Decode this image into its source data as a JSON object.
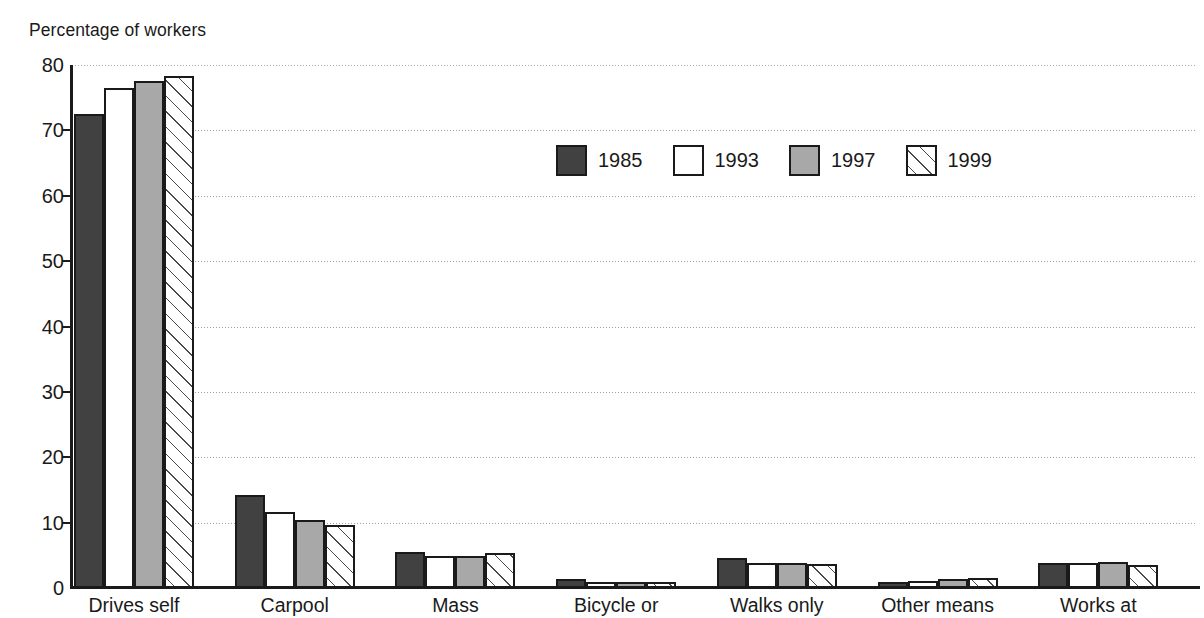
{
  "chart_data": {
    "type": "bar",
    "title": "",
    "ylabel": "Percentage of workers",
    "xlabel": "",
    "ylim": [
      0,
      80
    ],
    "ytick_step": 10,
    "yticks": [
      "0",
      "10",
      "20",
      "30",
      "40",
      "50",
      "60",
      "70",
      "80"
    ],
    "grid": true,
    "grid_axis": "y",
    "legend_position": "upper-center",
    "categories": [
      "Drives self",
      "Carpool",
      "Mass",
      "Bicycle or",
      "Walks only",
      "Other means",
      "Works at"
    ],
    "series": [
      {
        "name": "1985",
        "color": "#414141",
        "pattern": "solid-dark",
        "values": [
          72.5,
          14.3,
          5.5,
          1.4,
          4.6,
          0.9,
          3.8
        ]
      },
      {
        "name": "1993",
        "color": "#ffffff",
        "pattern": "white",
        "values": [
          76.5,
          11.7,
          4.9,
          0.8,
          3.9,
          1.1,
          3.9
        ]
      },
      {
        "name": "1997",
        "color": "#a8a8a8",
        "pattern": "solid-gray",
        "values": [
          77.5,
          10.4,
          4.9,
          0.8,
          3.8,
          1.4,
          4.0
        ]
      },
      {
        "name": "1999",
        "color": "#ffffff",
        "pattern": "diagonal-hatch",
        "values": [
          78.3,
          9.7,
          5.3,
          0.9,
          3.6,
          1.6,
          3.5
        ]
      }
    ]
  },
  "legend": {
    "items": [
      {
        "label": "1985"
      },
      {
        "label": "1993"
      },
      {
        "label": "1997"
      },
      {
        "label": "1999"
      }
    ]
  }
}
